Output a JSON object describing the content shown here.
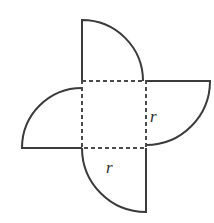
{
  "figure": {
    "background_color": "#ffffff",
    "stroke_color": "#3b3b3b",
    "dashed_stroke_color": "#4a4a4a",
    "label_color": "#2e2e2e",
    "labels": {
      "radius_right": "r",
      "radius_bottom": "r"
    },
    "square": {
      "left": 82,
      "top": 81,
      "right": 146,
      "bottom": 148,
      "side": 65,
      "style": "dashed"
    },
    "lobes": [
      {
        "name": "top-lobe",
        "center_corner": "bottom-left",
        "center": [
          82,
          81
        ],
        "radius": 61,
        "from": [
          82,
          20
        ],
        "to": [
          146,
          81
        ],
        "sweep": "clockwise"
      },
      {
        "name": "left-lobe",
        "center_corner": "bottom-right",
        "center": [
          82,
          148
        ],
        "radius": 60,
        "from": [
          82,
          81
        ],
        "to": [
          22,
          148
        ],
        "sweep": "clockwise"
      },
      {
        "name": "bottom-lobe",
        "center_corner": "top-right",
        "center": [
          146,
          148
        ],
        "radius": 64,
        "from": [
          146,
          212
        ],
        "to": [
          82,
          148
        ],
        "sweep": "clockwise"
      },
      {
        "name": "right-lobe",
        "center_corner": "top-left",
        "center": [
          146,
          81
        ],
        "radius": 64,
        "from": [
          210,
          81
        ],
        "to": [
          146,
          145
        ],
        "sweep": "clockwise"
      }
    ],
    "label_positions": {
      "radius_right": [
        150,
        122
      ],
      "radius_bottom": [
        106,
        173
      ]
    }
  }
}
